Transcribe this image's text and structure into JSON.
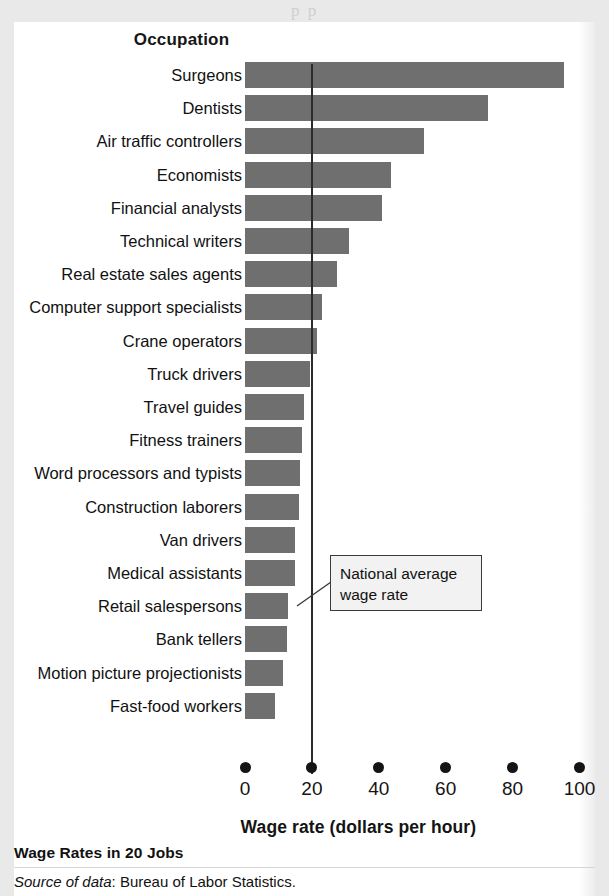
{
  "page": {
    "bleed_text": "p                                   p",
    "background_color": "#e9e9e9",
    "card_color": "#ffffff"
  },
  "column_header": "Occupation",
  "figure_title": "Wage Rates in 20 Jobs",
  "source": {
    "label": "Source of data",
    "text": ": Bureau of Labor Statistics."
  },
  "annotation": {
    "text": "National average wage rate",
    "value": 20
  },
  "chart_data": {
    "type": "bar",
    "orientation": "horizontal",
    "title": "Wage Rates in 20 Jobs",
    "xlabel": "Wage rate (dollars per hour)",
    "ylabel": "Occupation",
    "xlim": [
      0,
      100
    ],
    "xticks": [
      0,
      20,
      40,
      60,
      80,
      100
    ],
    "xticklabels": [
      "0",
      "20",
      "40",
      "60",
      "80",
      "100"
    ],
    "grid": false,
    "legend": null,
    "bar_color": "#6f6f6f",
    "reference_line": {
      "label": "National average wage rate",
      "value": 20,
      "color": "#2b2b2b"
    },
    "categories": [
      "Surgeons",
      "Dentists",
      "Air traffic controllers",
      "Economists",
      "Financial analysts",
      "Technical writers",
      "Real estate sales agents",
      "Computer support specialists",
      "Crane operators",
      "Truck drivers",
      "Travel guides",
      "Fitness trainers",
      "Word processors and typists",
      "Construction laborers",
      "Van drivers",
      "Medical assistants",
      "Retail salespersons",
      "Bank tellers",
      "Motion picture projectionists",
      "Fast-food workers"
    ],
    "values": [
      95.5,
      72.5,
      53.5,
      43.5,
      41,
      31,
      27.5,
      23,
      21.5,
      19.5,
      17.5,
      17,
      16.5,
      16,
      15,
      15,
      13,
      12.5,
      11.5,
      9
    ]
  }
}
